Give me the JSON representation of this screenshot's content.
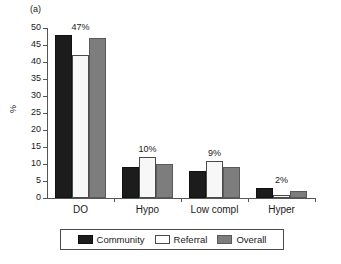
{
  "panel": {
    "label": "(a)"
  },
  "chart_data": {
    "type": "bar",
    "title": "",
    "subtitle": "",
    "xlabel": "",
    "ylabel": "%",
    "ylim": [
      0,
      50
    ],
    "yticks": [
      0,
      5,
      10,
      15,
      20,
      25,
      30,
      35,
      40,
      45,
      50
    ],
    "ytick_labels": [
      "0",
      "5",
      "10",
      "15",
      "20",
      "25",
      "30",
      "35",
      "40",
      "45",
      "50"
    ],
    "grid": false,
    "legend_position": "bottom",
    "categories": [
      "DO",
      "Hypo",
      "Low compl",
      "Hyper"
    ],
    "series": [
      {
        "name": "Community",
        "color": "#1c1c1c",
        "values": [
          48,
          9,
          8,
          3
        ]
      },
      {
        "name": "Referral",
        "color": "#f7f7f7",
        "values": [
          42,
          12,
          11,
          1
        ]
      },
      {
        "name": "Overall",
        "color": "#7d7d7d",
        "values": [
          47,
          10,
          9,
          2
        ]
      }
    ],
    "annotations": [
      {
        "category": "DO",
        "text": "47%"
      },
      {
        "category": "Hypo",
        "text": "10%"
      },
      {
        "category": "Low compl",
        "text": "9%"
      },
      {
        "category": "Hyper",
        "text": "2%"
      }
    ]
  },
  "legend": {
    "items": [
      {
        "label": "Community",
        "swatch": "community"
      },
      {
        "label": "Referral",
        "swatch": "referral"
      },
      {
        "label": "Overall",
        "swatch": "overall"
      }
    ]
  }
}
